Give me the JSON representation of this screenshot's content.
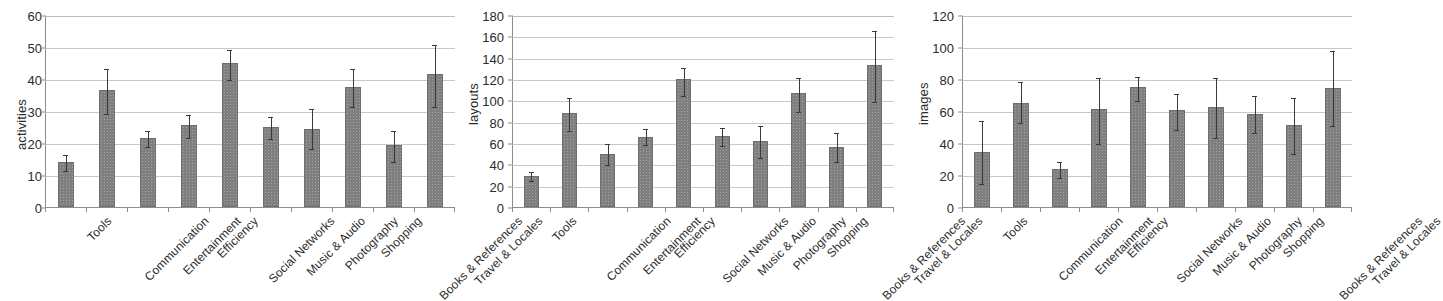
{
  "figure": {
    "background": "#ffffff",
    "bar_color": "#7f7f7f",
    "error_bar_color": "#3a3a3a",
    "gridline_color": "#c8c8c8",
    "axis_color": "#8d8d8d"
  },
  "categories": [
    "Tools",
    "Communication",
    "Entertainment",
    "Efficiency",
    "Social Networks",
    "Music & Audio",
    "Photography",
    "Shopping",
    "Books & References",
    "Travel & Locales"
  ],
  "chart_data": [
    {
      "type": "bar",
      "title": "",
      "xlabel": "",
      "ylabel": "activities",
      "ylim": [
        0,
        60
      ],
      "ytick_step": 10,
      "yticks": [
        0,
        10,
        20,
        30,
        40,
        50,
        60
      ],
      "grid": true,
      "legend": null,
      "categories": [
        "Tools",
        "Communication",
        "Entertainment",
        "Efficiency",
        "Social Networks",
        "Music & Audio",
        "Photography",
        "Shopping",
        "Books & References",
        "Travel & Locales"
      ],
      "values": [
        14,
        36.5,
        21.5,
        25.5,
        45,
        25,
        24.5,
        37.5,
        19.5,
        41.5
      ],
      "error_low": [
        11.5,
        29.5,
        19,
        22,
        40,
        21.5,
        18.5,
        31.5,
        14.5,
        31.5
      ],
      "error_high": [
        16.5,
        43.5,
        24,
        29,
        49.5,
        28.5,
        31,
        43.5,
        24,
        51
      ]
    },
    {
      "type": "bar",
      "title": "",
      "xlabel": "",
      "ylabel": "layouts",
      "ylim": [
        0,
        180
      ],
      "ytick_step": 20,
      "yticks": [
        0,
        20,
        40,
        60,
        80,
        100,
        120,
        140,
        160,
        180
      ],
      "grid": true,
      "legend": null,
      "categories": [
        "Tools",
        "Communication",
        "Entertainment",
        "Efficiency",
        "Social Networks",
        "Music & Audio",
        "Photography",
        "Shopping",
        "Books & References",
        "Travel & Locales"
      ],
      "values": [
        29,
        88,
        50,
        66,
        120,
        66.5,
        62,
        107,
        56,
        133
      ],
      "error_low": [
        25,
        72,
        40,
        59,
        105,
        58,
        47,
        90,
        43,
        99
      ],
      "error_high": [
        34,
        103,
        60,
        74,
        131,
        75,
        77,
        122,
        70,
        166
      ]
    },
    {
      "type": "bar",
      "title": "",
      "xlabel": "",
      "ylabel": "images",
      "ylim": [
        0,
        120
      ],
      "ytick_step": 20,
      "yticks": [
        0,
        20,
        40,
        60,
        80,
        100,
        120
      ],
      "grid": true,
      "legend": null,
      "categories": [
        "Tools",
        "Communication",
        "Entertainment",
        "Efficiency",
        "Social Networks",
        "Music & Audio",
        "Photography",
        "Shopping",
        "Books & References",
        "Travel & Locales"
      ],
      "values": [
        34.5,
        65,
        23.5,
        61,
        75,
        60.5,
        62.5,
        58,
        51.5,
        74.5
      ],
      "error_low": [
        15,
        53,
        19,
        40,
        67,
        49,
        44,
        47,
        34,
        51
      ],
      "error_high": [
        54.5,
        79,
        28.5,
        81,
        82,
        71,
        81,
        70,
        69,
        98
      ]
    }
  ]
}
